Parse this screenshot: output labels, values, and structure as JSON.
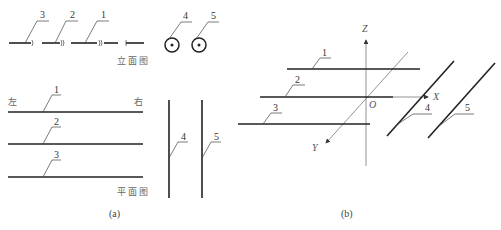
{
  "panel_a": {
    "caption": "(a)",
    "elevation": {
      "title": "立面图",
      "pipe_labels": [
        "3",
        "2",
        "1"
      ],
      "circle_labels": [
        "4",
        "5"
      ]
    },
    "plan": {
      "title": "平面图",
      "left_label": "左",
      "right_label": "右",
      "horizontal_pipe_labels": [
        "1",
        "2",
        "3"
      ],
      "vertical_pipe_labels": [
        "4",
        "5"
      ]
    }
  },
  "panel_b": {
    "caption": "(b)",
    "axes": {
      "z": "Z",
      "x": "X",
      "y": "Y",
      "origin": "O"
    },
    "pipe_labels": [
      "1",
      "2",
      "3",
      "4",
      "5"
    ]
  }
}
